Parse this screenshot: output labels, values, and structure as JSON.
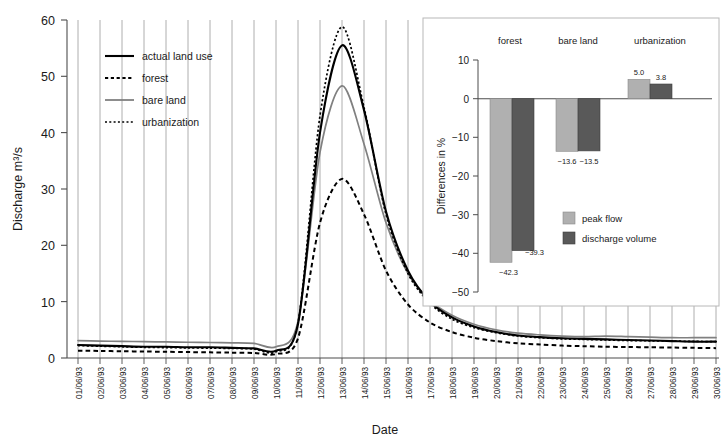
{
  "chart_data": [
    {
      "type": "line",
      "id": "main-hydrograph",
      "title": "",
      "xlabel": "Date",
      "ylabel": "Discharge m3/s",
      "ylabel_display": "Discharge m³/s",
      "ylim": [
        0,
        60
      ],
      "yticks": [
        0,
        10,
        20,
        30,
        40,
        50,
        60
      ],
      "grid": "vertical",
      "legend_position": "upper-left-inside",
      "categories": [
        "01/06/93",
        "02/06/93",
        "03/06/93",
        "04/06/93",
        "05/06/93",
        "06/06/93",
        "07/06/93",
        "08/06/93",
        "09/06/93",
        "10/06/93",
        "11/06/93",
        "12/06/93",
        "13/06/93",
        "14/06/93",
        "15/06/93",
        "16/06/93",
        "17/06/93",
        "18/06/93",
        "19/06/93",
        "20/06/93",
        "21/06/93",
        "22/06/93",
        "23/06/93",
        "24/06/93",
        "25/06/93",
        "26/06/93",
        "27/06/93",
        "28/06/93",
        "29/06/93",
        "30/06/93"
      ],
      "series": [
        {
          "name": "actual land use",
          "style": "solid-thick",
          "color": "#000000",
          "values": [
            2.3,
            2.2,
            2.1,
            2.0,
            2.0,
            1.9,
            1.9,
            1.8,
            1.7,
            1.3,
            6.0,
            40.0,
            55.5,
            44.0,
            26.0,
            15.5,
            10.0,
            7.2,
            5.6,
            4.6,
            4.0,
            3.7,
            3.5,
            3.4,
            3.3,
            3.2,
            3.1,
            3.0,
            2.9,
            2.9
          ]
        },
        {
          "name": "forest",
          "style": "dotted-coarse",
          "color": "#000000",
          "values": [
            1.3,
            1.25,
            1.2,
            1.15,
            1.1,
            1.05,
            1.0,
            0.95,
            0.9,
            0.7,
            3.5,
            24.0,
            31.8,
            25.5,
            15.5,
            9.5,
            6.3,
            4.6,
            3.6,
            3.0,
            2.6,
            2.4,
            2.2,
            2.1,
            2.0,
            1.95,
            1.9,
            1.85,
            1.8,
            1.75
          ]
        },
        {
          "name": "bare land",
          "style": "solid-gray",
          "color": "#808080",
          "values": [
            3.1,
            3.0,
            2.95,
            2.9,
            2.85,
            2.8,
            2.75,
            2.7,
            2.6,
            2.0,
            6.5,
            36.5,
            48.3,
            38.0,
            24.0,
            15.0,
            10.2,
            7.6,
            6.0,
            5.0,
            4.4,
            4.1,
            3.9,
            3.8,
            3.9,
            3.8,
            3.7,
            3.6,
            3.6,
            3.6
          ]
        },
        {
          "name": "urbanization",
          "style": "dotted-fine",
          "color": "#000000",
          "values": [
            2.2,
            2.1,
            2.0,
            1.9,
            1.85,
            1.8,
            1.75,
            1.7,
            1.6,
            1.1,
            6.2,
            43.0,
            58.8,
            44.5,
            25.5,
            15.0,
            9.7,
            6.9,
            5.4,
            4.5,
            3.9,
            3.6,
            3.4,
            3.3,
            3.2,
            3.1,
            3.05,
            3.0,
            2.95,
            2.9
          ]
        }
      ]
    },
    {
      "type": "bar",
      "id": "inset-differences",
      "title": "",
      "xlabel": "",
      "ylabel": "Differences in %",
      "ylim": [
        -50,
        10
      ],
      "yticks": [
        10,
        0,
        -10,
        -20,
        -30,
        -40,
        -50
      ],
      "grid": "none",
      "legend_position": "inside-lower-right",
      "categories": [
        "forest",
        "bare land",
        "urbanization"
      ],
      "series": [
        {
          "name": "peak flow",
          "color": "#b0b0b0",
          "values": [
            -42.3,
            -13.6,
            5.0
          ]
        },
        {
          "name": "discharge volume",
          "color": "#595959",
          "values": [
            -39.3,
            -13.5,
            3.8
          ]
        }
      ],
      "value_labels": [
        [
          "-42.3",
          "-13.6",
          "5.0"
        ],
        [
          "-39.3",
          "-13.5",
          "3.8"
        ]
      ]
    }
  ],
  "main": {
    "ylabel": "Discharge m³/s",
    "xlabel": "Date",
    "yticks": [
      "60",
      "50",
      "40",
      "30",
      "20",
      "10",
      "0"
    ],
    "xticks": [
      "01/06/93",
      "02/06/93",
      "03/06/93",
      "04/06/93",
      "05/06/93",
      "06/06/93",
      "07/06/93",
      "08/06/93",
      "09/06/93",
      "10/06/93",
      "11/06/93",
      "12/06/93",
      "13/06/93",
      "14/06/93",
      "15/06/93",
      "16/06/93",
      "17/06/93",
      "18/06/93",
      "19/06/93",
      "20/06/93",
      "21/06/93",
      "22/06/93",
      "23/06/93",
      "24/06/93",
      "25/06/93",
      "26/06/93",
      "27/06/93",
      "28/06/93",
      "29/06/93",
      "30/06/93"
    ],
    "legend": [
      {
        "label": "actual land use"
      },
      {
        "label": "forest"
      },
      {
        "label": "bare land"
      },
      {
        "label": "urbanization"
      }
    ]
  },
  "inset": {
    "ylabel": "Differences in %",
    "yticks": [
      "10",
      "0",
      "−10",
      "−20",
      "−30",
      "−40",
      "−50"
    ],
    "groups": [
      "forest",
      "bare land",
      "urbanization"
    ],
    "labels": {
      "forest_peak": "−42.3",
      "forest_volume": "−39.3",
      "bare_peak": "−13.6",
      "bare_volume": "−13.5",
      "urban_peak": "5.0",
      "urban_volume": "3.8"
    },
    "legend": [
      {
        "label": "peak flow"
      },
      {
        "label": "discharge volume"
      }
    ]
  },
  "colors": {
    "peak_flow": "#b0b0b0",
    "discharge_volume": "#595959",
    "bare_land_line": "#808080",
    "grid": "#9a9a9a",
    "axis": "#4d4d4d"
  }
}
